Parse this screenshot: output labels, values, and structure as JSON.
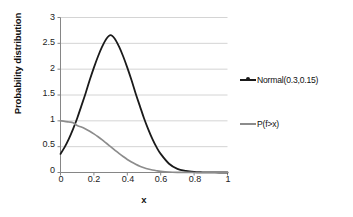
{
  "chart_data": {
    "type": "line",
    "title": "",
    "xlabel": "x",
    "ylabel": "Probability distribution",
    "xlim": [
      0,
      1
    ],
    "ylim": [
      0,
      3
    ],
    "grid": true,
    "grid_axis": "y",
    "legend_position": "right",
    "x_ticks": [
      "0",
      "0.2",
      "0.4",
      "0.6",
      "0.8",
      "1"
    ],
    "x_tick_values": [
      0,
      0.2,
      0.4,
      0.6,
      0.8,
      1
    ],
    "y_ticks": [
      "0",
      "0.5",
      "1",
      "1.5",
      "2",
      "2.5",
      "3"
    ],
    "y_tick_values": [
      0,
      0.5,
      1,
      1.5,
      2,
      2.5,
      3
    ],
    "series": [
      {
        "name": "Normal(0.3,0.15)",
        "color": "#1a1a1a",
        "x": [
          0,
          0.025,
          0.05,
          0.075,
          0.1,
          0.125,
          0.15,
          0.175,
          0.2,
          0.225,
          0.25,
          0.275,
          0.3,
          0.325,
          0.35,
          0.375,
          0.4,
          0.425,
          0.45,
          0.475,
          0.5,
          0.525,
          0.55,
          0.575,
          0.6,
          0.65,
          0.7,
          0.75,
          0.8,
          0.85,
          0.9,
          0.95,
          1
        ],
        "values": [
          0.36,
          0.49,
          0.65,
          0.84,
          1.05,
          1.29,
          1.53,
          1.79,
          2.03,
          2.25,
          2.44,
          2.59,
          2.66,
          2.59,
          2.44,
          2.25,
          2.03,
          1.79,
          1.53,
          1.29,
          1.05,
          0.84,
          0.65,
          0.49,
          0.36,
          0.17,
          0.07,
          0.03,
          0.01,
          0.004,
          0.001,
          0.0004,
          0.0001
        ]
      },
      {
        "name": "P(f>x)",
        "color": "#8c8c8c",
        "x": [
          0,
          0.025,
          0.05,
          0.075,
          0.1,
          0.125,
          0.15,
          0.175,
          0.2,
          0.225,
          0.25,
          0.275,
          0.3,
          0.325,
          0.35,
          0.375,
          0.4,
          0.425,
          0.45,
          0.475,
          0.5,
          0.525,
          0.55,
          0.575,
          0.6,
          0.65,
          0.7,
          0.75,
          0.8,
          0.85,
          0.9,
          0.95,
          1
        ],
        "values": [
          1.0,
          0.99,
          0.977,
          0.963,
          0.909,
          0.879,
          0.841,
          0.798,
          0.748,
          0.692,
          0.631,
          0.566,
          0.5,
          0.434,
          0.369,
          0.309,
          0.252,
          0.202,
          0.159,
          0.121,
          0.091,
          0.067,
          0.048,
          0.034,
          0.023,
          0.01,
          0.004,
          0.0013,
          0.0004,
          0.0001,
          3e-05,
          1e-05,
          0.0
        ]
      }
    ]
  },
  "legend": {
    "entries": [
      {
        "label": "Normal(0.3,0.15)",
        "color": "#1a1a1a",
        "marker": "line-with-dot"
      },
      {
        "label": "P(f>x)",
        "color": "#8c8c8c",
        "marker": "line"
      }
    ]
  },
  "axes": {
    "y_title": "Probability distribution",
    "x_title": "x",
    "axis_color": "#868686",
    "grid_color": "#d4d4d4"
  }
}
